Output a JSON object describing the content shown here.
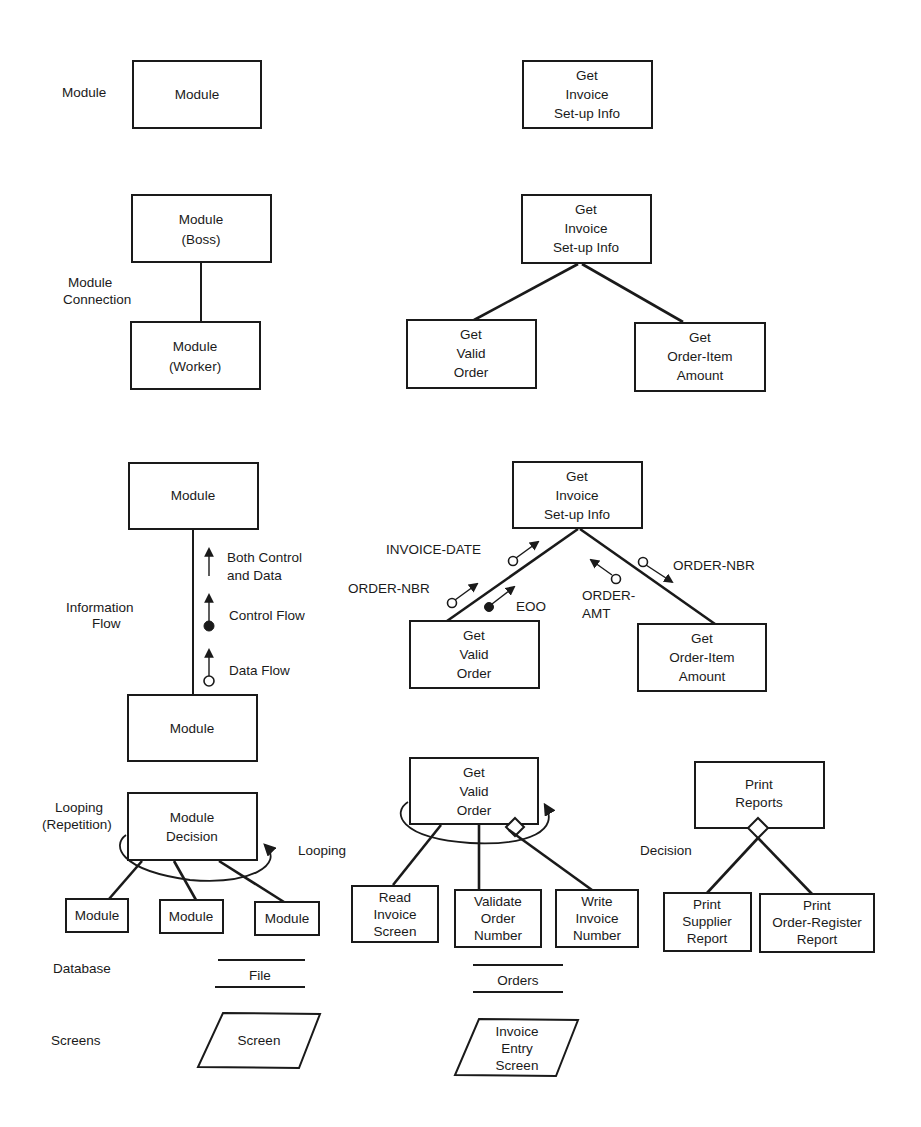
{
  "legend": {
    "module": {
      "label": "Module",
      "box": "Module",
      "example": [
        "Get",
        "Invoice",
        "Set-up Info"
      ]
    },
    "module_connection": {
      "label": [
        "Module",
        "Connection"
      ],
      "boss": [
        "Module",
        "(Boss)"
      ],
      "worker": [
        "Module",
        "(Worker)"
      ],
      "example": {
        "parent": [
          "Get",
          "Invoice",
          "Set-up Info"
        ],
        "children": [
          [
            "Get",
            "Valid",
            "Order"
          ],
          [
            "Get",
            "Order-Item",
            "Amount"
          ]
        ]
      }
    },
    "information_flow": {
      "label": [
        "Information",
        "Flow"
      ],
      "top_box": "Module",
      "bottom_box": "Module",
      "both_label": [
        "Both Control",
        "and Data"
      ],
      "control_label": "Control Flow",
      "data_label": "Data Flow",
      "example": {
        "parent": [
          "Get",
          "Invoice",
          "Set-up Info"
        ],
        "left_child": [
          "Get",
          "Valid",
          "Order"
        ],
        "right_child": [
          "Get",
          "Order-Item",
          "Amount"
        ],
        "couples": {
          "invoice_date": "INVOICE-DATE",
          "order_nbr_left": "ORDER-NBR",
          "eoo": "EOO",
          "order_amt": [
            "ORDER-",
            "AMT"
          ],
          "order_nbr_right": "ORDER-NBR"
        }
      }
    },
    "looping": {
      "label": [
        "Looping",
        "(Repetition)"
      ],
      "box": [
        "Module",
        "Decision"
      ],
      "children": [
        "Module",
        "Module",
        "Module"
      ],
      "side_label": "Looping",
      "example": {
        "parent": [
          "Get",
          "Valid",
          "Order"
        ],
        "children": [
          [
            "Read",
            "Invoice",
            "Screen"
          ],
          [
            "Validate",
            "Order",
            "Number"
          ],
          [
            "Write",
            "Invoice",
            "Number"
          ]
        ]
      }
    },
    "decision": {
      "label": "Decision",
      "example": {
        "parent": [
          "Print",
          "Reports"
        ],
        "children": [
          [
            "Print",
            "Supplier",
            "Report"
          ],
          [
            "Print",
            "Order-Register",
            "Report"
          ]
        ]
      }
    },
    "database": {
      "label": "Database",
      "symbol": "File",
      "example": "Orders"
    },
    "screens": {
      "label": "Screens",
      "symbol": "Screen",
      "example": [
        "Invoice",
        "Entry",
        "Screen"
      ]
    }
  },
  "colors": {
    "ink": "#1a1a1a",
    "paper": "#ffffff"
  }
}
